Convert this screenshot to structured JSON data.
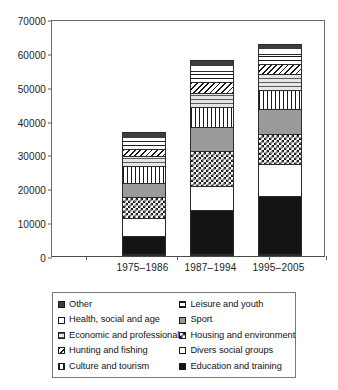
{
  "chart_data": {
    "type": "bar",
    "subtype": "stacked-bar",
    "title": "",
    "xlabel": "",
    "ylabel": "",
    "categories": [
      "1975–1986",
      "1987–1994",
      "1995–2005"
    ],
    "ylim": [
      0,
      70000
    ],
    "yticks": [
      0,
      10000,
      20000,
      30000,
      40000,
      50000,
      60000,
      70000
    ],
    "ytick_labels": [
      "0",
      "10000",
      "20000",
      "30000",
      "40000",
      "50000",
      "60000",
      "70000"
    ],
    "grid": false,
    "legend_position": "below",
    "stack_order_bottom_to_top": [
      "Education and training",
      "Divers social groups",
      "Housing and environment",
      "Sport",
      "Culture and tourism",
      "Economic and professional",
      "Hunting and fishing",
      "Leisure and youth",
      "Health, social and age",
      "Other"
    ],
    "series": [
      {
        "name": "Education and training",
        "pattern": "solid-black",
        "values": [
          5700,
          13300,
          17500
        ]
      },
      {
        "name": "Divers social groups",
        "pattern": "solid-white",
        "values": [
          5200,
          7000,
          9500
        ]
      },
      {
        "name": "Housing and environment",
        "pattern": "checkerboard",
        "values": [
          6300,
          10300,
          8600
        ]
      },
      {
        "name": "Sport",
        "pattern": "solid-gray",
        "values": [
          4000,
          7300,
          7400
        ]
      },
      {
        "name": "Culture and tourism",
        "pattern": "vertical-stripes",
        "values": [
          5200,
          5800,
          5800
        ]
      },
      {
        "name": "Economic and professional",
        "pattern": "light-horizontal",
        "values": [
          2700,
          4300,
          4600
        ]
      },
      {
        "name": "Hunting and fishing",
        "pattern": "diagonal-hatch",
        "values": [
          2100,
          3200,
          3000
        ]
      },
      {
        "name": "Leisure and youth",
        "pattern": "horizontal-stripes",
        "values": [
          2600,
          3200,
          3000
        ]
      },
      {
        "name": "Health, social and age",
        "pattern": "solid-white-thin",
        "values": [
          1100,
          1600,
          1700
        ]
      },
      {
        "name": "Other",
        "pattern": "solid-dark",
        "values": [
          1600,
          1800,
          1400
        ]
      }
    ],
    "totals": [
      36500,
      57800,
      62500
    ]
  },
  "legend": {
    "items": [
      {
        "label": "Other",
        "swatch": "solid-dark"
      },
      {
        "label": "Leisure and youth",
        "swatch": "horizontal-stripes"
      },
      {
        "label": "Health, social and age",
        "swatch": "solid-white-thin"
      },
      {
        "label": "Sport",
        "swatch": "solid-gray"
      },
      {
        "label": "Economic and professional",
        "swatch": "light-horizontal"
      },
      {
        "label": "Housing and environment",
        "swatch": "checkerboard"
      },
      {
        "label": "Hunting and fishing",
        "swatch": "diagonal-hatch"
      },
      {
        "label": "Divers social groups",
        "swatch": "solid-white"
      },
      {
        "label": "Culture and tourism",
        "swatch": "vertical-stripes"
      },
      {
        "label": "Education and training",
        "swatch": "solid-black"
      }
    ]
  },
  "colors": {
    "ink": "#141414",
    "axis": "#5a5a5a",
    "frame": "#6e6e6e",
    "background": "#ffffff",
    "gray": "#9a9a9a",
    "light_gray": "#c6c6c6",
    "dark_gray": "#3d3d3d"
  }
}
